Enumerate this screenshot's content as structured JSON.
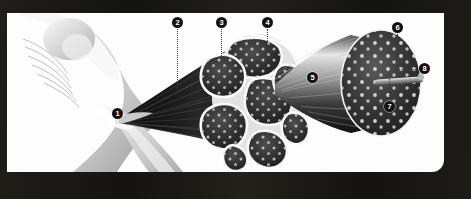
{
  "figure": {
    "style": "grayscale anatomical illustration",
    "frame_color": "#1a1814",
    "panel_color": "#fdfdfd",
    "marker_color": "#111111",
    "marker_text_color": "#ffffff",
    "leader_color": "#3a3a3a"
  },
  "callouts": [
    {
      "id": "1",
      "label": "1",
      "x": 117,
      "y": 113,
      "leader": "none"
    },
    {
      "id": "2",
      "label": "2",
      "x": 178,
      "y": 22,
      "leader": "vertical"
    },
    {
      "id": "3",
      "label": "3",
      "x": 222,
      "y": 22,
      "leader": "vertical"
    },
    {
      "id": "4",
      "label": "4",
      "x": 268,
      "y": 22,
      "leader": "vertical"
    },
    {
      "id": "5",
      "label": "5",
      "x": 312,
      "y": 77,
      "leader": "none"
    },
    {
      "id": "6",
      "label": "6",
      "x": 398,
      "y": 27,
      "leader": "vertical"
    },
    {
      "id": "7",
      "label": "7",
      "x": 390,
      "y": 106,
      "leader": "vertical"
    },
    {
      "id": "8",
      "label": "8",
      "x": 425,
      "y": 69,
      "leader": "horizontal"
    }
  ],
  "parts": {
    "arm": "upper arm and shoulder with biceps",
    "tendon": "tendon attachment point",
    "belly": "muscle belly with fanning fibers",
    "cross_section": "muscle cross-section showing fascicles",
    "fascicle": "single fascicle cylinder",
    "myofibril": "myofibril rod extending from fascicle"
  }
}
